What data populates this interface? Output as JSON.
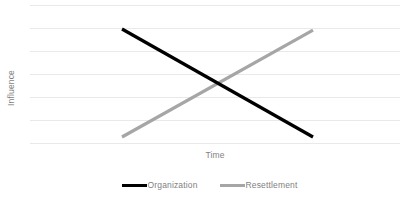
{
  "chart_data": {
    "type": "line",
    "title": "",
    "xlabel": "Time",
    "ylabel": "Influence",
    "x": [
      0,
      1
    ],
    "xlim": [
      0,
      1
    ],
    "ylim": [
      0,
      6
    ],
    "grid": true,
    "gridline_count": 7,
    "xtick_labels": [],
    "ytick_labels": [],
    "legend_position": "bottom-center",
    "series": [
      {
        "name": "Organization",
        "color": "#000000",
        "values": [
          5.0,
          0.35
        ],
        "trend": "decreasing"
      },
      {
        "name": "Resettlement",
        "color": "#a6a6a6",
        "values": [
          0.35,
          4.95
        ],
        "trend": "increasing"
      }
    ],
    "annotations": []
  },
  "axes": {
    "y_label": "Influence",
    "x_label": "Time"
  },
  "legend": {
    "items": [
      {
        "label": "Organization",
        "color": "#000000"
      },
      {
        "label": "Resettlement",
        "color": "#a6a6a6"
      }
    ]
  },
  "colors": {
    "gridline": "#e9e9e9",
    "axis_text": "#7f7f7f",
    "background": "#ffffff",
    "series_organization": "#000000",
    "series_resettlement": "#a6a6a6"
  }
}
